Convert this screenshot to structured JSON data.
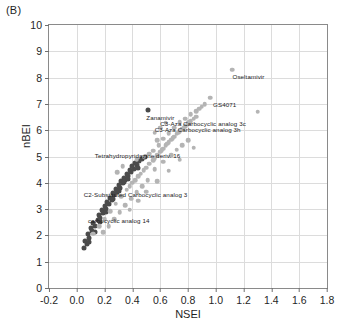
{
  "panel": {
    "label": "(B)"
  },
  "chart_data": {
    "type": "scatter",
    "title": "",
    "xlabel": "NSEI",
    "ylabel": "nBEI",
    "xlim": [
      -0.2,
      1.8
    ],
    "ylim": [
      0,
      10
    ],
    "xticks": [
      "-0.2",
      "0.0",
      "0.2",
      "0.4",
      "0.6",
      "0.8",
      "1.0",
      "1.2",
      "1.4",
      "1.6",
      "1.8"
    ],
    "xtick_values": [
      -0.2,
      0.0,
      0.2,
      0.4,
      0.6,
      0.8,
      1.0,
      1.2,
      1.4,
      1.6,
      1.8
    ],
    "yticks": [
      "0",
      "1",
      "2",
      "3",
      "4",
      "5",
      "6",
      "7",
      "8",
      "9",
      "10"
    ],
    "ytick_values": [
      0,
      1,
      2,
      3,
      4,
      5,
      6,
      7,
      8,
      9,
      10
    ],
    "grid": true,
    "legend": "none",
    "colors": {
      "dark_series": "#4a4a4a",
      "light_series": "#b4b4b4",
      "grid": "#dcdcdc",
      "frame": "#8a8a8a"
    },
    "series": [
      {
        "name": "dark",
        "color": "#4a4a4a",
        "points": [
          [
            0.05,
            1.52
          ],
          [
            0.07,
            1.66
          ],
          [
            0.06,
            1.8
          ],
          [
            0.09,
            1.92
          ],
          [
            0.08,
            2.05
          ],
          [
            0.11,
            2.16
          ],
          [
            0.1,
            2.28
          ],
          [
            0.13,
            2.35
          ],
          [
            0.12,
            2.48
          ],
          [
            0.15,
            2.57
          ],
          [
            0.17,
            2.66
          ],
          [
            0.16,
            2.78
          ],
          [
            0.19,
            2.86
          ],
          [
            0.18,
            2.95
          ],
          [
            0.21,
            3.02
          ],
          [
            0.2,
            3.12
          ],
          [
            0.23,
            3.18
          ],
          [
            0.22,
            3.28
          ],
          [
            0.25,
            3.34
          ],
          [
            0.24,
            3.44
          ],
          [
            0.27,
            3.52
          ],
          [
            0.26,
            3.6
          ],
          [
            0.29,
            3.66
          ],
          [
            0.28,
            3.76
          ],
          [
            0.31,
            3.82
          ],
          [
            0.3,
            3.92
          ],
          [
            0.33,
            3.98
          ],
          [
            0.32,
            4.06
          ],
          [
            0.35,
            4.12
          ],
          [
            0.34,
            4.2
          ],
          [
            0.37,
            4.26
          ],
          [
            0.36,
            4.34
          ],
          [
            0.39,
            4.4
          ],
          [
            0.38,
            4.48
          ],
          [
            0.41,
            4.54
          ],
          [
            0.4,
            4.62
          ],
          [
            0.43,
            4.68
          ],
          [
            0.42,
            4.76
          ],
          [
            0.45,
            4.82
          ],
          [
            0.47,
            4.9
          ],
          [
            0.49,
            4.98
          ],
          [
            0.34,
            4.02
          ],
          [
            0.3,
            3.7
          ],
          [
            0.26,
            3.4
          ],
          [
            0.21,
            2.9
          ],
          [
            0.17,
            2.5
          ],
          [
            0.13,
            2.12
          ],
          [
            0.09,
            1.74
          ],
          [
            0.44,
            4.58
          ],
          [
            0.37,
            4.16
          ],
          [
            0.51,
            6.78
          ]
        ]
      },
      {
        "name": "light",
        "color": "#b4b4b4",
        "points": [
          [
            0.12,
            2.06
          ],
          [
            0.16,
            2.36
          ],
          [
            0.2,
            2.62
          ],
          [
            0.24,
            2.92
          ],
          [
            0.28,
            3.2
          ],
          [
            0.32,
            3.48
          ],
          [
            0.36,
            3.74
          ],
          [
            0.4,
            4.0
          ],
          [
            0.44,
            4.24
          ],
          [
            0.48,
            4.48
          ],
          [
            0.52,
            4.72
          ],
          [
            0.56,
            4.94
          ],
          [
            0.58,
            5.06
          ],
          [
            0.6,
            5.18
          ],
          [
            0.62,
            5.3
          ],
          [
            0.64,
            5.42
          ],
          [
            0.66,
            5.54
          ],
          [
            0.68,
            5.64
          ],
          [
            0.7,
            5.76
          ],
          [
            0.72,
            5.86
          ],
          [
            0.74,
            5.96
          ],
          [
            0.76,
            6.06
          ],
          [
            0.78,
            6.16
          ],
          [
            0.8,
            6.26
          ],
          [
            0.82,
            6.34
          ],
          [
            0.84,
            6.44
          ],
          [
            0.86,
            6.52
          ],
          [
            0.61,
            5.24
          ],
          [
            0.65,
            5.48
          ],
          [
            0.69,
            5.7
          ],
          [
            0.73,
            5.9
          ],
          [
            0.77,
            6.1
          ],
          [
            0.81,
            6.3
          ],
          [
            0.55,
            4.86
          ],
          [
            0.5,
            4.58
          ],
          [
            0.46,
            4.34
          ],
          [
            0.42,
            4.1
          ],
          [
            0.38,
            3.86
          ],
          [
            0.55,
            5.22
          ],
          [
            0.59,
            5.44
          ],
          [
            0.48,
            5.0
          ],
          [
            0.43,
            4.9
          ],
          [
            0.52,
            5.1
          ],
          [
            0.62,
            5.68
          ],
          [
            0.66,
            5.88
          ],
          [
            0.7,
            6.1
          ],
          [
            0.74,
            6.3
          ],
          [
            0.58,
            5.62
          ],
          [
            0.78,
            6.44
          ],
          [
            0.82,
            6.6
          ],
          [
            0.86,
            6.72
          ],
          [
            0.9,
            6.9
          ],
          [
            0.96,
            7.24
          ],
          [
            1.12,
            8.3
          ],
          [
            1.3,
            6.7
          ],
          [
            0.64,
            6.28
          ],
          [
            0.6,
            6.1
          ],
          [
            0.56,
            5.9
          ],
          [
            0.88,
            6.82
          ],
          [
            0.92,
            6.98
          ],
          [
            0.51,
            4.1
          ],
          [
            0.47,
            3.88
          ],
          [
            0.43,
            3.64
          ],
          [
            0.39,
            3.4
          ],
          [
            0.35,
            3.14
          ],
          [
            0.31,
            2.88
          ],
          [
            0.27,
            2.62
          ],
          [
            0.23,
            2.36
          ],
          [
            0.19,
            2.12
          ],
          [
            0.84,
            5.34
          ],
          [
            0.74,
            4.88
          ],
          [
            0.66,
            4.46
          ],
          [
            0.58,
            4.06
          ],
          [
            0.5,
            3.66
          ],
          [
            0.44,
            3.32
          ],
          [
            0.38,
            2.98
          ],
          [
            0.56,
            4.52
          ],
          [
            0.62,
            4.8
          ],
          [
            0.68,
            5.06
          ],
          [
            0.72,
            5.26
          ],
          [
            0.76,
            5.44
          ],
          [
            0.8,
            5.62
          ],
          [
            0.33,
            4.62
          ],
          [
            0.29,
            4.4
          ]
        ]
      }
    ],
    "annotations": [
      {
        "text": "Oseltamivir",
        "x": 1.12,
        "y": 8.05,
        "align": "left"
      },
      {
        "text": "GS4071",
        "x": 0.98,
        "y": 7.0,
        "align": "left"
      },
      {
        "text": "Zanamivir",
        "x": 0.5,
        "y": 6.5,
        "align": "left"
      },
      {
        "text": "C3-Aza Carbocyclic analog 3c",
        "x": 0.6,
        "y": 6.28,
        "align": "left"
      },
      {
        "text": "C3-Aza Carbocyclic analog 3h",
        "x": 0.56,
        "y": 6.05,
        "align": "left"
      },
      {
        "text": "Tetrahydropyridazine deriv. 16",
        "x": 0.13,
        "y": 5.05,
        "align": "left"
      },
      {
        "text": "C2-Substituted Carbocyclic analog 3",
        "x": 0.05,
        "y": 3.58,
        "align": "left"
      },
      {
        "text": "carbocyclic analog 14",
        "x": 0.08,
        "y": 2.58,
        "align": "left"
      }
    ]
  }
}
